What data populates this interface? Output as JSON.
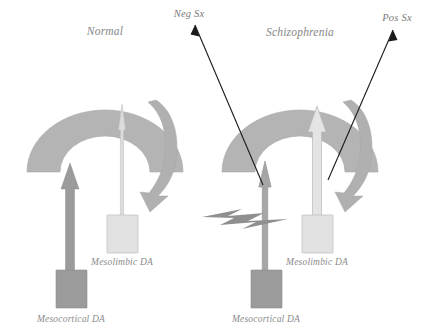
{
  "figure": {
    "type": "diagram",
    "width": 428,
    "height": 335,
    "background_color": "#ffffff"
  },
  "panels": [
    {
      "id": "normal",
      "title": "Normal",
      "cortex": {
        "name": "cortex-arc",
        "color": "#b4b4b4"
      },
      "pathways": [
        {
          "id": "mesocortical",
          "label": "Mesocortical DA",
          "arrow_style": "thick",
          "color": "#9b9b9b",
          "box_color": "#9b9b9b"
        },
        {
          "id": "mesolimbic",
          "label": "Mesolimbic DA",
          "arrow_style": "thin",
          "color": "#dcdcdc",
          "box_color": "#e2e2e2"
        }
      ],
      "feedback_arrow": {
        "name": "feedback-curved-arrow",
        "color": "#b0b0b0"
      }
    },
    {
      "id": "schizophrenia",
      "title": "Schizophrenia",
      "cortex": {
        "name": "cortex-arc",
        "color": "#b4b4b4"
      },
      "pathways": [
        {
          "id": "mesocortical",
          "label": "Mesocortical DA",
          "arrow_style": "thin",
          "color": "#a6a6a6",
          "box_color": "#9b9b9b"
        },
        {
          "id": "mesolimbic",
          "label": "Mesolimbic DA",
          "arrow_style": "thick",
          "color": "#e4e4e4",
          "box_color": "#e2e2e2"
        }
      ],
      "feedback_arrow": {
        "name": "feedback-curved-arrow",
        "color": "#b0b0b0"
      },
      "blockade": {
        "name": "lightning-bolt",
        "color": "#8f8f8f"
      }
    }
  ],
  "symptom_callouts": [
    {
      "id": "neg-sx",
      "label": "Neg Sx",
      "pointer_color": "#1a1a1a"
    },
    {
      "id": "pos-sx",
      "label": "Pos Sx",
      "pointer_color": "#1a1a1a"
    }
  ],
  "colors": {
    "cortex": "#b4b4b4",
    "dark_gray": "#9b9b9b",
    "light_gray": "#e2e2e2",
    "pointer": "#1a1a1a",
    "text": "#7d7d7d"
  }
}
